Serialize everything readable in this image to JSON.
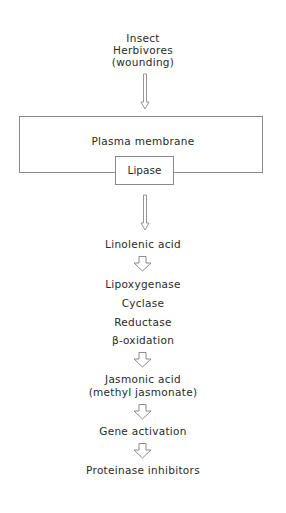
{
  "diagram": {
    "source": {
      "line1": "Insect",
      "line2": "Herbivores",
      "line3": "(wounding)"
    },
    "membrane": {
      "label": "Plasma membrane",
      "enzyme": "Lipase"
    },
    "steps": {
      "linolenic": "Linolenic acid",
      "enzymes": [
        "Lipoxygenase",
        "Cyclase",
        "Reductase",
        "β-oxidation"
      ],
      "jasmonic_line1": "Jasmonic acid",
      "jasmonic_line2": "(methyl jasmonate)",
      "gene": "Gene activation",
      "product": "Proteinase inhibitors"
    },
    "colors": {
      "line": "#8a8a8a",
      "text": "#2a2a2a"
    }
  }
}
